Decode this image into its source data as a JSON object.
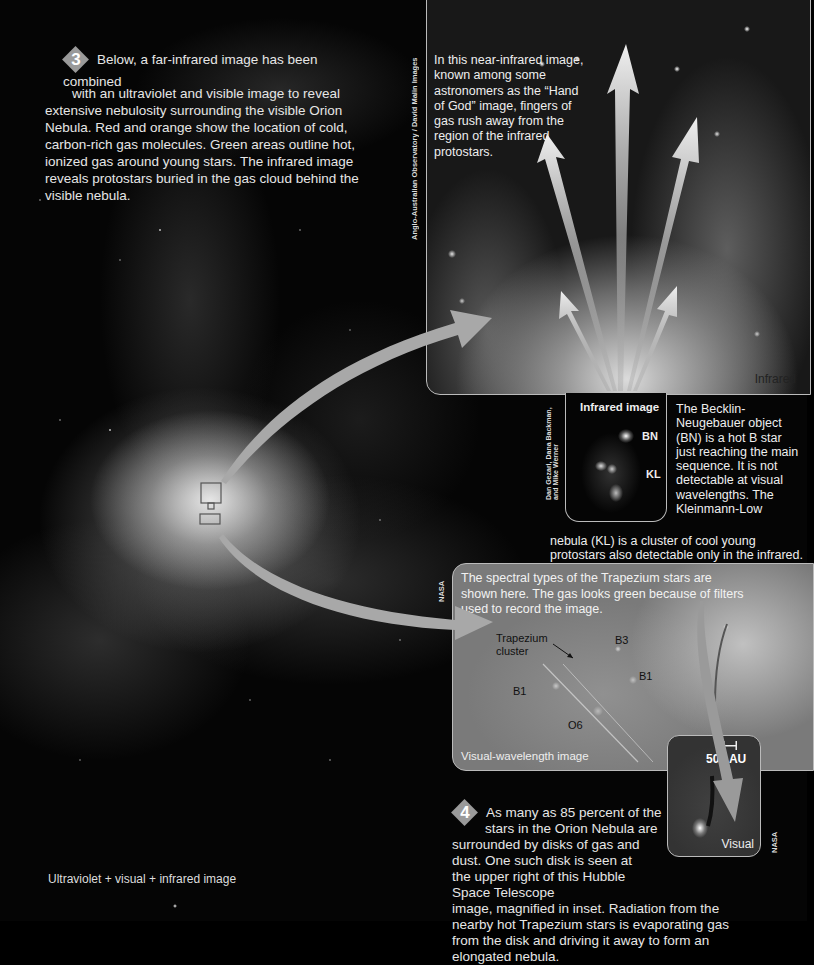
{
  "main_image": {
    "caption": "Ultraviolet + visual + infrared image"
  },
  "step3": {
    "number": "3",
    "text_line1": "Below, a far-infrared image has been combined",
    "text_line2": "with an ultraviolet and visible image to reveal",
    "text_rest": "extensive nebulosity surrounding the visible Orion Nebula. Red and orange show the location of cold, carbon-rich gas molecules. Green areas outline hot, ionized gas around young stars. The infrared image reveals protostars buried in the gas cloud behind the visible nebula."
  },
  "infrared_panel": {
    "credit": "Anglo-Australian Observatory / David Malin Images",
    "description": "In this near-infrared image, known among some astronomers as the “Hand of God” image, fingers of gas rush away from the region of the infrared protostars.",
    "label": "Infrared"
  },
  "infrared_inset": {
    "credit": "Dan Gezari, Dana Backman, and Mike Werner",
    "title": "Infrared image",
    "labels": [
      "BN",
      "KL"
    ],
    "description_side": "The Becklin-Neugebauer object (BN) is a hot B star just reaching the main sequence. It is not detectable at visual wavelengths. The Kleinmann-Low",
    "description_bottom": "nebula (KL) is a cluster of cool young protostars also detectable only in the infrared."
  },
  "visual_panel": {
    "credit": "NASA",
    "description": "The spectral types of the Trapezium stars are shown here. The gas looks green because of filters used to record the image.",
    "cluster_label": "Trapezium cluster",
    "star_labels": [
      "B3",
      "B1",
      "B1",
      "O6"
    ],
    "label": "Visual-wavelength image"
  },
  "disk_inset": {
    "scale": "500 AU",
    "label": "Visual",
    "credit": "NASA"
  },
  "step4": {
    "number": "4",
    "text_line1": "As many as 85 percent of the",
    "text_line2": "stars in the Orion Nebula are",
    "text_rest": "surrounded by disks of gas and dust. One such disk is seen at the upper right of this Hubble Space Telescope",
    "text_wide": "image, magnified in inset. Radiation from the nearby hot Trapezium stars is evaporating gas from the disk and driving it away to form an elongated nebula."
  },
  "colors": {
    "background": "#050505",
    "arrow": "#a8a8a8",
    "panel_border": "#bbbbbb",
    "text": "#e6e6e6"
  }
}
